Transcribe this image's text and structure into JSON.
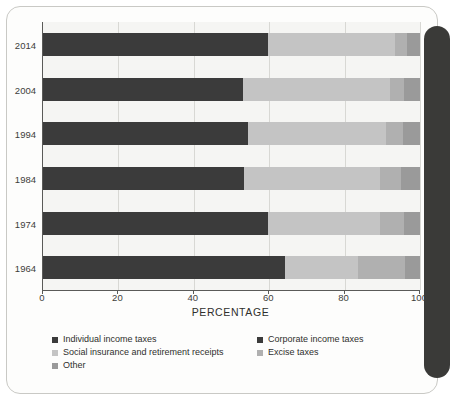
{
  "chart_data": {
    "type": "bar",
    "orientation": "horizontal",
    "stacked": true,
    "title": "",
    "xlabel": "PERCENTAGE",
    "ylabel": "",
    "xlim": [
      0,
      100
    ],
    "xticks": [
      0,
      20,
      40,
      60,
      80,
      100
    ],
    "grid": true,
    "legend_position": "bottom",
    "categories": [
      "2014",
      "2004",
      "1994",
      "1984",
      "1974",
      "1964"
    ],
    "series": [
      {
        "name": "Individual income taxes",
        "color": "#3b3b3b",
        "values": [
          49.0,
          43.0,
          43.1,
          44.8,
          45.0,
          43.2
        ]
      },
      {
        "name": "Corporate income taxes",
        "color": "#3b3b3b",
        "values": [
          10.6,
          10.1,
          11.2,
          8.5,
          14.7,
          20.9
        ]
      },
      {
        "name": "Social insurance and retirement receipts",
        "color": "#c4c4c4",
        "values": [
          33.9,
          39.0,
          36.7,
          36.0,
          29.8,
          19.5
        ]
      },
      {
        "name": "Excise taxes",
        "color": "#b0b0b0",
        "values": [
          3.1,
          3.7,
          4.4,
          5.6,
          6.3,
          12.3
        ]
      },
      {
        "name": "Other",
        "color": "#9a9a9a",
        "values": [
          3.4,
          4.2,
          4.6,
          5.1,
          4.2,
          4.1
        ]
      }
    ]
  },
  "axis": {
    "x_tick_labels": [
      "0",
      "20",
      "40",
      "60",
      "80",
      "100"
    ],
    "y_tick_labels": [
      "2014",
      "2004",
      "1994",
      "1984",
      "1974",
      "1964"
    ],
    "x_axis_title": "PERCENTAGE"
  },
  "legend": {
    "items": [
      {
        "label": "Individual income taxes",
        "color": "#3b3b3b"
      },
      {
        "label": "Corporate income taxes",
        "color": "#3b3b3b"
      },
      {
        "label": "Social insurance and retirement receipts",
        "color": "#c4c4c4"
      },
      {
        "label": "Excise taxes",
        "color": "#b0b0b0"
      },
      {
        "label": "Other",
        "color": "#9a9a9a"
      }
    ]
  },
  "colors": {
    "page_background": "#fdfdfc",
    "plot_background": "#f5f5f3",
    "axis": "#5a5a58",
    "gridline": "#d8d8d4",
    "binding_strip": "#3a3a38",
    "text": "#3d3d3b"
  }
}
